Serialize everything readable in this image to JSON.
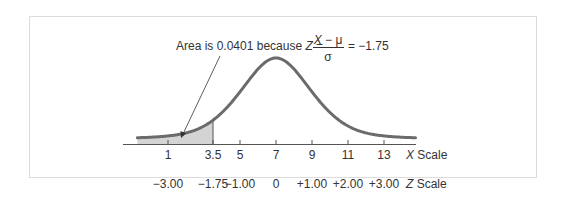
{
  "chart_data": {
    "type": "area",
    "title": "",
    "annotation": {
      "prefix": "Area is 0.0401 because",
      "z_symbol": "Z",
      "equals": "=",
      "numerator": "X − μ",
      "denominator": "σ",
      "result": "= −1.75"
    },
    "distribution": {
      "mean": 7,
      "sd": 2,
      "shaded_below_x": 3.5,
      "shaded_area": 0.0401
    },
    "x_scale": {
      "label_var": "X",
      "label": "Scale",
      "ticks": [
        "1",
        "3.5",
        "5",
        "7",
        "9",
        "11",
        "13"
      ],
      "values": [
        1,
        3.5,
        5,
        7,
        9,
        11,
        13
      ]
    },
    "z_scale": {
      "label_var": "Z",
      "label": "Scale",
      "ticks": [
        "−3.00",
        "−1.75",
        "−1.00",
        "0",
        "+1.00",
        "+2.00",
        "+3.00"
      ],
      "values": [
        -3.0,
        -1.75,
        -1.0,
        0,
        1.0,
        2.0,
        3.0
      ]
    },
    "xlabel": "X Scale",
    "ylabel": "",
    "grid": false,
    "legend": null
  }
}
